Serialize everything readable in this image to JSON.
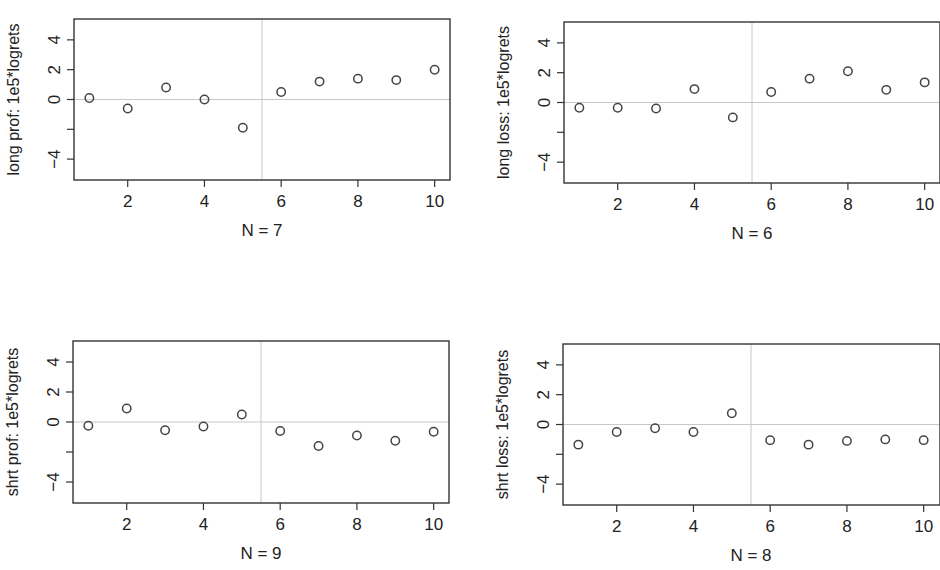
{
  "chart_data": [
    {
      "type": "scatter",
      "id": "long-prof",
      "title": "",
      "xlabel": "N = 7",
      "ylabel": "long prof: 1e5*logrets",
      "x": [
        1,
        2,
        3,
        4,
        5,
        6,
        7,
        8,
        9,
        10
      ],
      "values": [
        0.1,
        -0.6,
        0.8,
        0.0,
        -1.9,
        0.5,
        1.2,
        1.4,
        1.3,
        2.0
      ],
      "xticks": [
        2,
        4,
        6,
        8,
        10
      ],
      "yticks": [
        -4,
        -2,
        0,
        2,
        4
      ],
      "ytick_labels": [
        "-4",
        "",
        "0",
        "2",
        "4"
      ],
      "xlim": [
        0.6,
        10.4
      ],
      "ylim": [
        -5.4,
        5.4
      ],
      "hline": 0,
      "vline": 5.5,
      "grid": false,
      "box": {
        "left": 74,
        "top": 19,
        "right": 450,
        "bottom": 180
      }
    },
    {
      "type": "scatter",
      "id": "long-loss",
      "title": "",
      "xlabel": "N = 6",
      "ylabel": "long loss: 1e5*logrets",
      "x": [
        1,
        2,
        3,
        4,
        5,
        6,
        7,
        8,
        9,
        10
      ],
      "values": [
        -0.35,
        -0.35,
        -0.4,
        0.9,
        -1.0,
        0.7,
        1.6,
        2.1,
        0.85,
        1.35
      ],
      "xticks": [
        2,
        4,
        6,
        8,
        10
      ],
      "yticks": [
        -4,
        -2,
        0,
        2,
        4
      ],
      "ytick_labels": [
        "-4",
        "",
        "0",
        "2",
        "4"
      ],
      "xlim": [
        0.6,
        10.4
      ],
      "ylim": [
        -5.4,
        5.4
      ],
      "hline": 0,
      "vline": 5.5,
      "grid": false,
      "box": {
        "left": 564,
        "top": 22,
        "right": 940,
        "bottom": 183
      }
    },
    {
      "type": "scatter",
      "id": "shrt-prof",
      "title": "",
      "xlabel": "N = 9",
      "ylabel": "shrt prof: 1e5*logrets",
      "x": [
        1,
        2,
        3,
        4,
        5,
        6,
        7,
        8,
        9,
        10
      ],
      "values": [
        -0.25,
        0.9,
        -0.55,
        -0.3,
        0.5,
        -0.6,
        -1.6,
        -0.9,
        -1.25,
        -0.65
      ],
      "xticks": [
        2,
        4,
        6,
        8,
        10
      ],
      "yticks": [
        -4,
        -2,
        0,
        2,
        4
      ],
      "ytick_labels": [
        "-4",
        "",
        "0",
        "2",
        "4"
      ],
      "xlim": [
        0.6,
        10.4
      ],
      "ylim": [
        -5.4,
        5.4
      ],
      "hline": 0,
      "vline": 5.5,
      "grid": false,
      "box": {
        "left": 73,
        "top": 341,
        "right": 449,
        "bottom": 503
      }
    },
    {
      "type": "scatter",
      "id": "shrt-loss",
      "title": "",
      "xlabel": "N = 8",
      "ylabel": "shrt loss: 1e5*logrets",
      "x": [
        1,
        2,
        3,
        4,
        5,
        6,
        7,
        8,
        9,
        10
      ],
      "values": [
        -1.35,
        -0.5,
        -0.25,
        -0.5,
        0.75,
        -1.05,
        -1.35,
        -1.1,
        -1.0,
        -1.05
      ],
      "xticks": [
        2,
        4,
        6,
        8,
        10
      ],
      "yticks": [
        -4,
        -2,
        0,
        2,
        4
      ],
      "ytick_labels": [
        "-4",
        "",
        "0",
        "2",
        "4"
      ],
      "xlim": [
        0.6,
        10.4
      ],
      "ylim": [
        -5.4,
        5.4
      ],
      "hline": 0,
      "vline": 5.5,
      "grid": false,
      "box": {
        "left": 563,
        "top": 344,
        "right": 940,
        "bottom": 505
      }
    }
  ],
  "colors": {
    "axis": "#333333",
    "points": "#444444",
    "reference_lines": "#c8c8c8",
    "background": "#ffffff"
  }
}
